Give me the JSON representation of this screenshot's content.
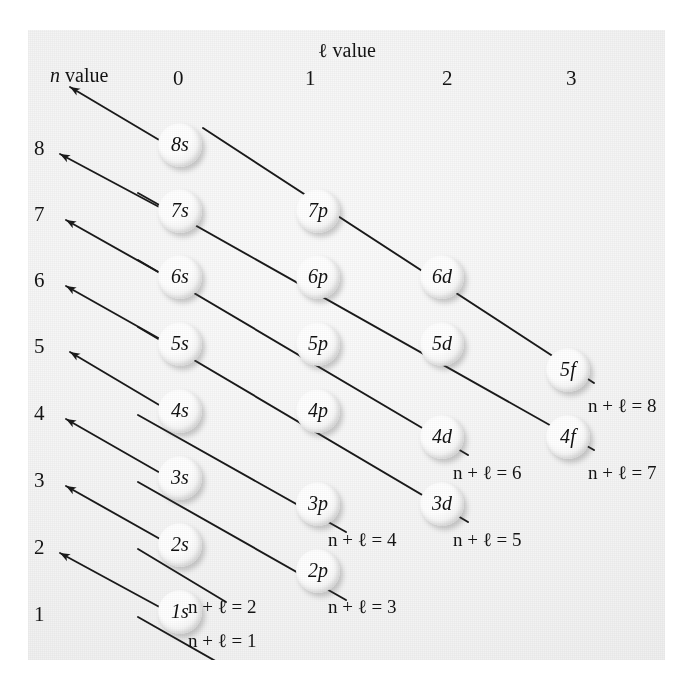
{
  "figure": {
    "axis_title_l": "ℓ value",
    "axis_title_n": "n value",
    "column_headers": [
      "0",
      "1",
      "2",
      "3"
    ],
    "n_values": [
      "8",
      "7",
      "6",
      "5",
      "4",
      "3",
      "2",
      "1"
    ],
    "orbitals": [
      {
        "label": "8s",
        "n": 8,
        "l": 0
      },
      {
        "label": "7s",
        "n": 7,
        "l": 0
      },
      {
        "label": "7p",
        "n": 7,
        "l": 1
      },
      {
        "label": "6s",
        "n": 6,
        "l": 0
      },
      {
        "label": "6p",
        "n": 6,
        "l": 1
      },
      {
        "label": "6d",
        "n": 6,
        "l": 2
      },
      {
        "label": "5s",
        "n": 5,
        "l": 0
      },
      {
        "label": "5p",
        "n": 5,
        "l": 1
      },
      {
        "label": "5d",
        "n": 5,
        "l": 2
      },
      {
        "label": "5f",
        "n": 5,
        "l": 3
      },
      {
        "label": "4s",
        "n": 4,
        "l": 0
      },
      {
        "label": "4p",
        "n": 4,
        "l": 1
      },
      {
        "label": "4d",
        "n": 4,
        "l": 2
      },
      {
        "label": "4f",
        "n": 4,
        "l": 3
      },
      {
        "label": "3s",
        "n": 3,
        "l": 0
      },
      {
        "label": "3p",
        "n": 3,
        "l": 1
      },
      {
        "label": "3d",
        "n": 3,
        "l": 2
      },
      {
        "label": "2s",
        "n": 2,
        "l": 0
      },
      {
        "label": "2p",
        "n": 2,
        "l": 1
      },
      {
        "label": "1s",
        "n": 1,
        "l": 0
      }
    ],
    "sum_labels": [
      "n + ℓ = 8",
      "n + ℓ = 7",
      "n + ℓ = 6",
      "n + ℓ = 5",
      "n + ℓ = 4",
      "n + ℓ = 3",
      "n + ℓ = 2",
      "n + ℓ = 1"
    ],
    "colors": {
      "panel_background": "#f2f2f2",
      "line": "#1a1a1a",
      "text": "#141414",
      "sphere_highlight": "#ffffff"
    }
  },
  "caption": {
    "text": ""
  }
}
